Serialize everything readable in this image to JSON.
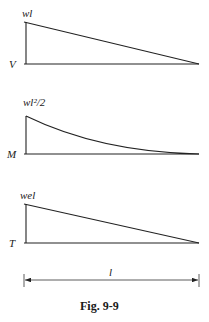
{
  "figure": {
    "caption": "Fig. 9-9",
    "diagrams": [
      {
        "axis_label": "V",
        "peak_label": "wl",
        "shape": "linear",
        "description": "shear force diagram"
      },
      {
        "axis_label": "M",
        "peak_label": "wl²/2",
        "shape": "parabolic",
        "description": "bending moment diagram"
      },
      {
        "axis_label": "T",
        "peak_label": "wel",
        "shape": "linear",
        "description": "torque diagram"
      }
    ],
    "dimension": {
      "label": "l"
    }
  }
}
